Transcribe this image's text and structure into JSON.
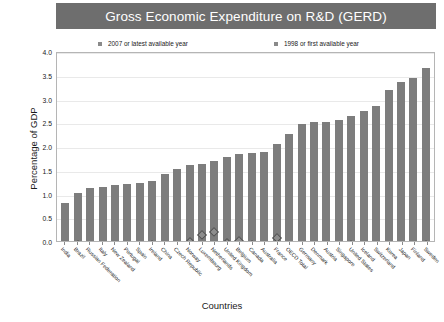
{
  "title": "Gross Economic Expenditure on R&D (GERD)",
  "legend": {
    "items": [
      {
        "label": "2007 or latest available year",
        "color": "#7d7d7d",
        "marker": "square"
      },
      {
        "label": "1998 or first available year",
        "color": "#8d8d8d",
        "marker": "diamond"
      }
    ]
  },
  "axes": {
    "ylabel": "Percentage of GDP",
    "xlabel": "Countries",
    "yticks": [
      "0.0",
      "0.5",
      "1.0",
      "1.5",
      "2.0",
      "2.5",
      "3.0",
      "3.5",
      "4.0"
    ]
  },
  "colors": {
    "title_banner": "#6e6e6e",
    "title_text": "#ffffff",
    "bar": "#7d7d7d",
    "marker": "#8d8d8d",
    "grid": "#e9e9e9",
    "frame": "#b5b5b5"
  },
  "chart_data": {
    "type": "bar",
    "title": "Gross Economic Expenditure on R&D (GERD)",
    "xlabel": "Countries",
    "ylabel": "Percentage of GDP",
    "ylim": [
      0.0,
      4.0
    ],
    "ytick_step": 0.5,
    "grid": true,
    "legend_position": "top",
    "categories": [
      "India",
      "Brazil",
      "Russian Federation",
      "Italy",
      "New Zealand",
      "Portugal",
      "Spain",
      "Ireland",
      "China",
      "Czech Republic",
      "Norway",
      "Luxembourg",
      "Netherlands",
      "United Kingdom",
      "Belgium",
      "Canada",
      "Australia",
      "France",
      "OECD Total",
      "Germany",
      "Denmark",
      "Austria",
      "Singapore",
      "United States",
      "Iceland",
      "Switzerland",
      "Korea",
      "Japan",
      "Finland",
      "Sweden"
    ],
    "series": [
      {
        "name": "2007 or latest available year",
        "type": "bar",
        "values": [
          0.8,
          1.02,
          1.12,
          1.14,
          1.2,
          1.21,
          1.24,
          1.27,
          1.43,
          1.53,
          1.62,
          1.63,
          1.7,
          1.78,
          1.85,
          1.87,
          1.89,
          2.06,
          2.28,
          2.49,
          2.53,
          2.54,
          2.57,
          2.66,
          2.76,
          2.88,
          3.21,
          3.39,
          3.46,
          3.68
        ]
      },
      {
        "name": "1998 or first available year",
        "type": "scatter",
        "values": [
          0.69,
          0.95,
          0.98,
          1.05,
          1.0,
          0.66,
          0.86,
          1.2,
          0.65,
          1.12,
          1.6,
          1.77,
          1.9,
          1.75,
          1.85,
          1.8,
          1.48,
          2.14,
          2.18,
          2.27,
          2.04,
          1.77,
          1.85,
          2.58,
          1.98,
          2.63,
          2.3,
          2.95,
          2.84,
          3.6
        ]
      }
    ]
  }
}
